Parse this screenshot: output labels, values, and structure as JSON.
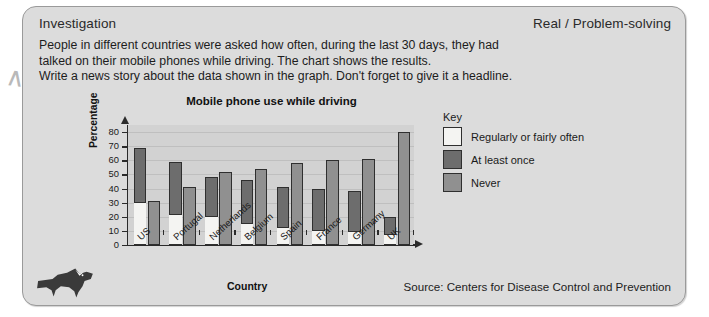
{
  "header": {
    "left_label": "Investigation",
    "right_label": "Real / Problem-solving"
  },
  "instructions": {
    "line1": "People in different countries were asked how often, during the last 30 days, they had",
    "line2": "talked on their mobile phones while driving. The chart shows the results.",
    "line3": "Write a news story about the data shown in the graph. Don't forget to give it a headline."
  },
  "key": {
    "title": "Key",
    "items": [
      {
        "label": "Regularly or fairly often",
        "color": "#f4f4f2"
      },
      {
        "label": "At least once",
        "color": "#6d6d6d"
      },
      {
        "label": "Never",
        "color": "#909090"
      }
    ]
  },
  "footer": {
    "source": "Source: Centers for Disease Control and Prevention",
    "logo": "running-fox-logo"
  },
  "chart_data": {
    "type": "bar",
    "title": "Mobile phone use while driving",
    "xlabel": "Country",
    "ylabel": "Percentage",
    "ylim": [
      0,
      85
    ],
    "yticks": [
      0,
      10,
      20,
      30,
      40,
      50,
      60,
      70,
      80
    ],
    "grid": true,
    "legend_position": "right",
    "stacking": "Regularly or fairly often is stacked inside At least once; Never is a separate adjacent bar",
    "categories": [
      "US",
      "Portugal",
      "Netherlands",
      "Belgium",
      "Spain",
      "France",
      "Germany",
      "UK"
    ],
    "series": [
      {
        "name": "Regularly or fairly often",
        "color": "#f4f4f2",
        "values": [
          30,
          21,
          20,
          15,
          12,
          10,
          9,
          7
        ]
      },
      {
        "name": "At least once",
        "color": "#6d6d6d",
        "values": [
          69,
          59,
          48,
          46,
          41,
          40,
          38,
          20
        ]
      },
      {
        "name": "Never",
        "color": "#909090",
        "values": [
          31,
          41,
          52,
          54,
          58,
          60,
          61,
          80
        ]
      }
    ]
  }
}
